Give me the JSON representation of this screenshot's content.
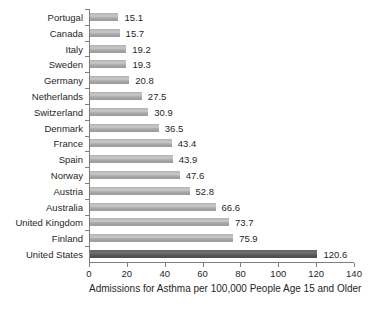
{
  "chart_data": {
    "type": "bar",
    "orientation": "horizontal",
    "title": "",
    "xlabel": "Admissions for Asthma per 100,000 People Age 15 and Older",
    "ylabel": "",
    "xlim": [
      0,
      140
    ],
    "x_ticks": [
      0,
      20,
      40,
      60,
      80,
      100,
      120,
      140
    ],
    "grid": false,
    "legend": false,
    "categories": [
      "Portugal",
      "Canada",
      "Italy",
      "Sweden",
      "Germany",
      "Netherlands",
      "Switzerland",
      "Denmark",
      "France",
      "Spain",
      "Norway",
      "Austria",
      "Australia",
      "United Kingdom",
      "Finland",
      "United States"
    ],
    "values": [
      15.1,
      15.7,
      19.2,
      19.3,
      20.8,
      27.5,
      30.9,
      36.5,
      43.4,
      43.9,
      47.6,
      52.8,
      66.6,
      73.7,
      75.9,
      120.6
    ],
    "value_labels": [
      "15.1",
      "15.7",
      "19.2",
      "19.3",
      "20.8",
      "27.5",
      "30.9",
      "36.5",
      "43.4",
      "43.9",
      "47.6",
      "52.8",
      "66.6",
      "73.7",
      "75.9",
      "120.6"
    ],
    "highlight_category": "United States",
    "colors": {
      "bar": "#ababab",
      "bar_highlight": "#595959",
      "axis": "#7f7f7f",
      "text": "#1f1f1f",
      "background": "#ffffff"
    }
  }
}
